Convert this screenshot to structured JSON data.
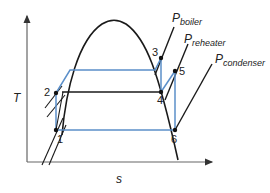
{
  "diagram": {
    "axes": {
      "y_label": "T",
      "x_label": "s"
    },
    "isobars": [
      {
        "id": "boiler",
        "label_main": "P",
        "label_sub": "boiler"
      },
      {
        "id": "reheater",
        "label_main": "P",
        "label_sub": "reheater"
      },
      {
        "id": "condenser",
        "label_main": "P",
        "label_sub": "condenser"
      }
    ],
    "states": [
      {
        "id": "1",
        "label": "1"
      },
      {
        "id": "2",
        "label": "2"
      },
      {
        "id": "3",
        "label": "3"
      },
      {
        "id": "4",
        "label": "4"
      },
      {
        "id": "5",
        "label": "5"
      },
      {
        "id": "6",
        "label": "6"
      }
    ],
    "colors": {
      "cycle_line": "#5b8fc9",
      "curve_line": "#1a1a1a",
      "axis": "#555555"
    }
  }
}
